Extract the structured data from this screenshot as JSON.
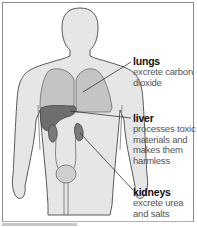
{
  "diagram": {
    "colors": {
      "body_fill": "#e6e6e6",
      "body_outline": "#5a5a5a",
      "lungs_fill": "#c4c4c4",
      "liver_fill": "#6e6e6e",
      "kidneys_fill": "#7a7a7a",
      "bladder_fill": "#cfcfcf",
      "leader_line": "#333333"
    },
    "labels": [
      {
        "organ": "lungs",
        "title": "lungs",
        "lines": [
          "excrete carbon",
          "dioxide"
        ]
      },
      {
        "organ": "liver",
        "title": "liver",
        "lines": [
          "processes toxic",
          "materials and",
          "makes them",
          "harmless"
        ]
      },
      {
        "organ": "kidneys",
        "title": "kidneys",
        "lines": [
          "excrete urea",
          "and salts"
        ]
      }
    ]
  }
}
